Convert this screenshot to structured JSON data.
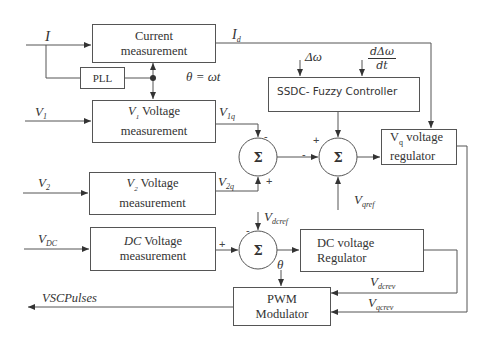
{
  "diagram": {
    "blocks": {
      "current_measurement": {
        "line1": "Current",
        "line2": "measurement"
      },
      "pll": {
        "label": "PLL"
      },
      "v1_measurement": {
        "prefix": "V",
        "prefix_sub": "1",
        "line1": "Voltage",
        "line2": "measurement"
      },
      "v2_measurement": {
        "prefix": "V",
        "prefix_sub": "2",
        "line1": "Voltage",
        "line2": "measurement"
      },
      "dc_measurement": {
        "prefix": "DC",
        "line1": "Voltage",
        "line2": "measurement"
      },
      "ssdc_fuzzy": {
        "label": "SSDC- Fuzzy Controller"
      },
      "vq_regulator": {
        "prefix": "V",
        "prefix_sub": "q",
        "line1": "voltage",
        "line2": "regulator"
      },
      "dc_regulator": {
        "line1": "DC voltage",
        "line2": "Regulator"
      },
      "pwm_modulator": {
        "line1": "PWM",
        "line2": "Modulator"
      }
    },
    "summers": {
      "sum1": {
        "symbol": "Σ",
        "top_sign": "-",
        "bottom_sign": "+"
      },
      "sum2": {
        "symbol": "Σ",
        "left_sign": "-",
        "top_sign": "+"
      },
      "sum3": {
        "symbol": "Σ",
        "top_sign": "-",
        "left_sign": "+"
      }
    },
    "signals": {
      "I": {
        "main": "I",
        "sub": ""
      },
      "Id": {
        "main": "I",
        "sub": "d"
      },
      "theta_eq": {
        "text": "θ = ωt"
      },
      "V1": {
        "main": "V",
        "sub": "1"
      },
      "V1q": {
        "main": "V",
        "sub": "1q"
      },
      "V2": {
        "main": "V",
        "sub": "2"
      },
      "V2q": {
        "main": "V",
        "sub": "2q"
      },
      "VDC": {
        "main": "V",
        "sub": "DC"
      },
      "delta_omega": {
        "text": "Δω"
      },
      "d_delta_omega_num": {
        "text": "dΔω"
      },
      "d_delta_omega_den": {
        "text": "dt"
      },
      "Vqref": {
        "main": "V",
        "sub": "qref"
      },
      "Vdcref": {
        "main": "V",
        "sub": "dcref"
      },
      "theta": {
        "text": "θ"
      },
      "Vdcrev": {
        "main": "V",
        "sub": "dcrev"
      },
      "Vqcrev": {
        "main": "V",
        "sub": "qcrev"
      },
      "vsc_pulses": {
        "text": "VSCPulses"
      }
    }
  }
}
